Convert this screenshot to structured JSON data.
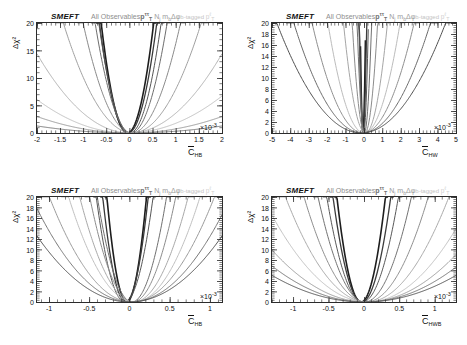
{
  "figure": {
    "title_tag": "SMEFT",
    "header": {
      "smeft": "SMEFT",
      "observables": "All Observables",
      "pt": "p",
      "pt_sup": "ττ",
      "pt_sub": "T",
      "nj": "N",
      "nj_sub": "j",
      "mb": "m",
      "mb_sub": "b",
      "dphi": "Δφ",
      "tagged": "b-tagged",
      "ptl": "p",
      "ptl_sup": "ℓ",
      "ptl_sub": "T"
    },
    "ylabel": "Δχ²",
    "exponent_label": "×10",
    "exponent_sup": "-3"
  },
  "chart_data": [
    {
      "type": "line",
      "panel": "top-left",
      "title": "SMEFT All Observables",
      "xlabel": "C̄_HB",
      "xlabel_base": "C",
      "xlabel_sub": "HB",
      "ylabel": "Δχ²",
      "xlim": [
        -2,
        2
      ],
      "ylim": [
        0,
        20
      ],
      "xticks": [
        -2,
        -1.5,
        -1,
        -0.5,
        0,
        0.5,
        1,
        1.5,
        2
      ],
      "xtick_labels": [
        "-2",
        "-1.5",
        "-1",
        "-0.5",
        "0",
        "0.5",
        "1",
        "1.5",
        "2"
      ],
      "yticks": [
        0,
        5,
        10,
        15,
        20
      ],
      "ytick_labels": [
        "0",
        "5",
        "10",
        "15",
        "20"
      ],
      "x_scale_exponent": -3,
      "grid": false,
      "legend": "none",
      "description": "Overlaid Δχ² parabolas from individual fits; each curve is a parabola a*(x-x0)^2 with differing curvature.",
      "series": [
        {
          "name": "fit-1",
          "color": "#1d1d1d",
          "width": 1.6,
          "a": 62.0,
          "x0": -0.045
        },
        {
          "name": "fit-2",
          "color": "#3a3a3a",
          "width": 1.3,
          "a": 52.0,
          "x0": -0.03
        },
        {
          "name": "fit-3",
          "color": "#555555",
          "width": 1.0,
          "a": 44.0,
          "x0": 0.01
        },
        {
          "name": "fit-4",
          "color": "#6e6e6e",
          "width": 1.0,
          "a": 33.0,
          "x0": 0.035
        },
        {
          "name": "fit-5",
          "color": "#8a8a8a",
          "width": 1.0,
          "a": 18.0,
          "x0": 0.05
        },
        {
          "name": "fit-6",
          "color": "#a0a0a0",
          "width": 1.0,
          "a": 9.0,
          "x0": 0.06
        },
        {
          "name": "fit-7",
          "color": "#b4b4b4",
          "width": 1.0,
          "a": 3.6,
          "x0": 0.0
        },
        {
          "name": "fit-8",
          "color": "#c2c2c2",
          "width": 1.0,
          "a": 1.6,
          "x0": -0.05
        },
        {
          "name": "fit-9",
          "color": "#9c9c9c",
          "width": 1.0,
          "a": 0.75,
          "x0": 0.0
        },
        {
          "name": "fit-10",
          "color": "#7c7c7c",
          "width": 1.0,
          "a": 0.32,
          "x0": 0.0
        }
      ]
    },
    {
      "type": "line",
      "panel": "top-right",
      "title": "SMEFT All Observables",
      "xlabel": "C̄_HW",
      "xlabel_base": "C",
      "xlabel_sub": "HW",
      "ylabel": "Δχ²",
      "xlim": [
        -5,
        5
      ],
      "ylim": [
        0,
        20
      ],
      "xticks": [
        -5,
        -4,
        -3,
        -2,
        -1,
        0,
        1,
        2,
        3,
        4,
        5
      ],
      "xtick_labels": [
        "-5",
        "-4",
        "-3",
        "-2",
        "-1",
        "0",
        "1",
        "2",
        "3",
        "4",
        "5"
      ],
      "yticks": [
        0,
        2,
        4,
        6,
        8,
        10,
        12,
        14,
        16,
        18,
        20
      ],
      "ytick_labels": [
        "0",
        "2",
        "4",
        "6",
        "8",
        "10",
        "12",
        "14",
        "16",
        "18",
        "20"
      ],
      "x_scale_exponent": -3,
      "grid": false,
      "legend": "none",
      "description": "Overlaid Δχ² parabolas; narrower set near zero plus wider shallow curves.",
      "series": [
        {
          "name": "fit-1",
          "color": "#1d1d1d",
          "width": 1.6,
          "a": 900.0,
          "x0": -0.06
        },
        {
          "name": "fit-2",
          "color": "#3c3c3c",
          "width": 1.3,
          "a": 520.0,
          "x0": -0.05
        },
        {
          "name": "fit-3",
          "color": "#565656",
          "width": 1.0,
          "a": 300.0,
          "x0": -0.02
        },
        {
          "name": "fit-4",
          "color": "#707070",
          "width": 1.0,
          "a": 130.0,
          "x0": 0.02
        },
        {
          "name": "fit-5",
          "color": "#8c8c8c",
          "width": 1.0,
          "a": 42.0,
          "x0": 0.05
        },
        {
          "name": "fit-6",
          "color": "#a6a6a6",
          "width": 1.0,
          "a": 14.0,
          "x0": 0.08
        },
        {
          "name": "fit-7",
          "color": "#bcbcbc",
          "width": 1.0,
          "a": 5.2,
          "x0": 0.0
        },
        {
          "name": "fit-8",
          "color": "#8f8f8f",
          "width": 1.0,
          "a": 2.6,
          "x0": -0.05
        },
        {
          "name": "fit-9",
          "color": "#6a6a6a",
          "width": 1.0,
          "a": 1.45,
          "x0": -0.1
        },
        {
          "name": "fit-10",
          "color": "#4f4f4f",
          "width": 1.0,
          "a": 0.95,
          "x0": -0.15
        }
      ]
    },
    {
      "type": "line",
      "panel": "bottom-left",
      "title": "SMEFT All Observables",
      "xlabel": "C̄_HB",
      "xlabel_base": "C",
      "xlabel_sub": "HB",
      "ylabel": "Δχ²",
      "xlim": [
        -1.15,
        1.15
      ],
      "ylim": [
        0,
        20
      ],
      "xticks": [
        -1,
        -0.5,
        0,
        0.5,
        1
      ],
      "xtick_labels": [
        "-1",
        "-0.5",
        "0",
        "0.5",
        "1"
      ],
      "yticks": [
        0,
        2,
        4,
        6,
        8,
        10,
        12,
        14,
        16,
        18,
        20
      ],
      "ytick_labels": [
        "0",
        "2",
        "4",
        "6",
        "8",
        "10",
        "12",
        "14",
        "16",
        "18",
        "20"
      ],
      "x_scale_exponent": -3,
      "grid": false,
      "legend": "none",
      "description": "Overlaid Δχ² parabolas on a narrower coefficient range.",
      "series": [
        {
          "name": "fit-1",
          "color": "#1d1d1d",
          "width": 1.6,
          "a": 330.0,
          "x0": -0.035
        },
        {
          "name": "fit-2",
          "color": "#3a3a3a",
          "width": 1.3,
          "a": 250.0,
          "x0": -0.05
        },
        {
          "name": "fit-3",
          "color": "#565656",
          "width": 1.0,
          "a": 160.0,
          "x0": -0.06
        },
        {
          "name": "fit-4",
          "color": "#707070",
          "width": 1.0,
          "a": 108.0,
          "x0": 0.03
        },
        {
          "name": "fit-5",
          "color": "#8c8c8c",
          "width": 1.0,
          "a": 70.0,
          "x0": 0.04
        },
        {
          "name": "fit-6",
          "color": "#a8a8a8",
          "width": 1.0,
          "a": 44.0,
          "x0": 0.055
        },
        {
          "name": "fit-7",
          "color": "#c0c0c0",
          "width": 1.0,
          "a": 30.0,
          "x0": 0.06
        },
        {
          "name": "fit-8",
          "color": "#9a9a9a",
          "width": 1.0,
          "a": 19.0,
          "x0": 0.03
        },
        {
          "name": "fit-9",
          "color": "#757575",
          "width": 1.0,
          "a": 13.0,
          "x0": 0.02
        },
        {
          "name": "fit-10",
          "color": "#545454",
          "width": 1.0,
          "a": 9.5,
          "x0": 0.0
        }
      ]
    },
    {
      "type": "line",
      "panel": "bottom-right",
      "title": "SMEFT All Observables",
      "xlabel": "C̄_HWB",
      "xlabel_base": "C",
      "xlabel_sub": "HWB",
      "ylabel": "Δχ²",
      "xlim": [
        -1.3,
        1.3
      ],
      "ylim": [
        0,
        20
      ],
      "xticks": [
        -1,
        -0.5,
        0,
        0.5,
        1
      ],
      "xtick_labels": [
        "-1",
        "-0.5",
        "0",
        "0.5",
        "1"
      ],
      "yticks": [
        0,
        2,
        4,
        6,
        8,
        10,
        12,
        14,
        16,
        18,
        20
      ],
      "ytick_labels": [
        "0",
        "2",
        "4",
        "6",
        "8",
        "10",
        "12",
        "14",
        "16",
        "18",
        "20"
      ],
      "x_scale_exponent": -3,
      "grid": false,
      "legend": "none",
      "description": "Overlaid Δχ² parabolas, broadest spread of curvatures of the four panels.",
      "series": [
        {
          "name": "fit-1",
          "color": "#1d1d1d",
          "width": 1.6,
          "a": 170.0,
          "x0": -0.04
        },
        {
          "name": "fit-2",
          "color": "#3c3c3c",
          "width": 1.3,
          "a": 120.0,
          "x0": -0.03
        },
        {
          "name": "fit-3",
          "color": "#585858",
          "width": 1.0,
          "a": 78.0,
          "x0": -0.02
        },
        {
          "name": "fit-4",
          "color": "#727272",
          "width": 1.0,
          "a": 46.0,
          "x0": 0.01
        },
        {
          "name": "fit-5",
          "color": "#8e8e8e",
          "width": 1.0,
          "a": 26.0,
          "x0": 0.03
        },
        {
          "name": "fit-6",
          "color": "#aaaaaa",
          "width": 1.0,
          "a": 15.0,
          "x0": 0.045
        },
        {
          "name": "fit-7",
          "color": "#c2c2c2",
          "width": 1.0,
          "a": 9.0,
          "x0": 0.055
        },
        {
          "name": "fit-8",
          "color": "#9e9e9e",
          "width": 1.0,
          "a": 5.6,
          "x0": 0.03
        },
        {
          "name": "fit-9",
          "color": "#787878",
          "width": 1.0,
          "a": 4.0,
          "x0": 0.01
        },
        {
          "name": "fit-10",
          "color": "#555555",
          "width": 1.0,
          "a": 3.0,
          "x0": 0.0
        }
      ]
    }
  ]
}
